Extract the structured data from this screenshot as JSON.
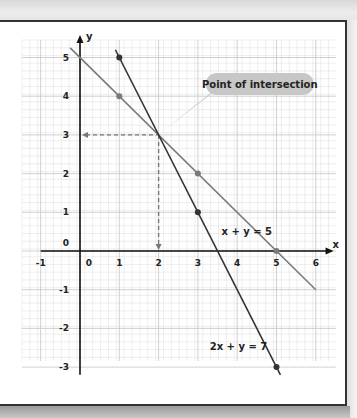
{
  "chart_data": {
    "type": "line",
    "title": "",
    "xlabel": "x",
    "ylabel": "y",
    "xlim": [
      -1,
      6
    ],
    "ylim": [
      -3,
      5
    ],
    "grid": true,
    "x_ticks": [
      "-1",
      "0",
      "1",
      "2",
      "3",
      "4",
      "5",
      "6"
    ],
    "y_ticks": [
      "5",
      "4",
      "3",
      "2",
      "1",
      "0",
      "-1",
      "-2",
      "-3"
    ],
    "series": [
      {
        "name": "x + y = 5",
        "label": "x + y = 5",
        "color": "#7a7a7a",
        "x": [
          -0.25,
          6
        ],
        "y": [
          5.25,
          -1
        ],
        "points": [
          {
            "x": 1,
            "y": 4
          },
          {
            "x": 3,
            "y": 2
          },
          {
            "x": 5,
            "y": 0
          }
        ]
      },
      {
        "name": "2x + y = 7",
        "label": "2x + y = 7",
        "color": "#333333",
        "x": [
          0.9,
          5.1
        ],
        "y": [
          5.2,
          -3.2
        ],
        "points": [
          {
            "x": 1,
            "y": 5
          },
          {
            "x": 3,
            "y": 1
          },
          {
            "x": 5,
            "y": -3
          }
        ]
      }
    ],
    "annotations": [
      {
        "text": "Point of intersection",
        "x": 2,
        "y": 3
      }
    ],
    "intersection": {
      "x": 2,
      "y": 3
    }
  }
}
